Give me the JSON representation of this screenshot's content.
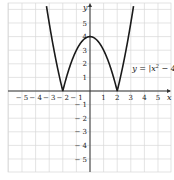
{
  "chart_data": {
    "type": "line",
    "title": "",
    "xlabel": "x",
    "ylabel": "y",
    "xlim": [
      -6,
      6
    ],
    "ylim": [
      -6,
      6.5
    ],
    "grid": true,
    "x_ticks": [
      -5,
      -4,
      -3,
      -2,
      -1,
      1,
      2,
      3,
      4,
      5
    ],
    "y_ticks": [
      -5,
      -4,
      -3,
      -2,
      -1,
      1,
      2,
      3,
      4,
      5
    ],
    "x_tick_labels": [
      "− 5",
      "− 4",
      "− 3",
      "− 2",
      "− 1",
      "1",
      "2",
      "3",
      "4",
      "5"
    ],
    "y_tick_labels": [
      "− 5",
      "− 4",
      "− 3",
      "− 2",
      "− 1",
      "1",
      "2",
      "3",
      "4",
      "5"
    ],
    "series": [
      {
        "name": "y = |x² − 4|",
        "function": "abs(x^2 - 4)",
        "key_points": [
          {
            "x": -2,
            "y": 0
          },
          {
            "x": 0,
            "y": 4
          },
          {
            "x": 2,
            "y": 0
          }
        ]
      }
    ],
    "annotations": [
      {
        "text": "y = |x² − 4|",
        "x": 3.1,
        "y": 1.5
      }
    ]
  },
  "labels": {
    "x_axis": "x",
    "y_axis": "y",
    "equation_prefix": "y = |x",
    "equation_exp": "2",
    "equation_suffix": " − 4|"
  },
  "colors": {
    "grid": "#d8d8d8",
    "axis": "#333333",
    "curve": "#1a1a1a",
    "background": "#ffffff"
  }
}
